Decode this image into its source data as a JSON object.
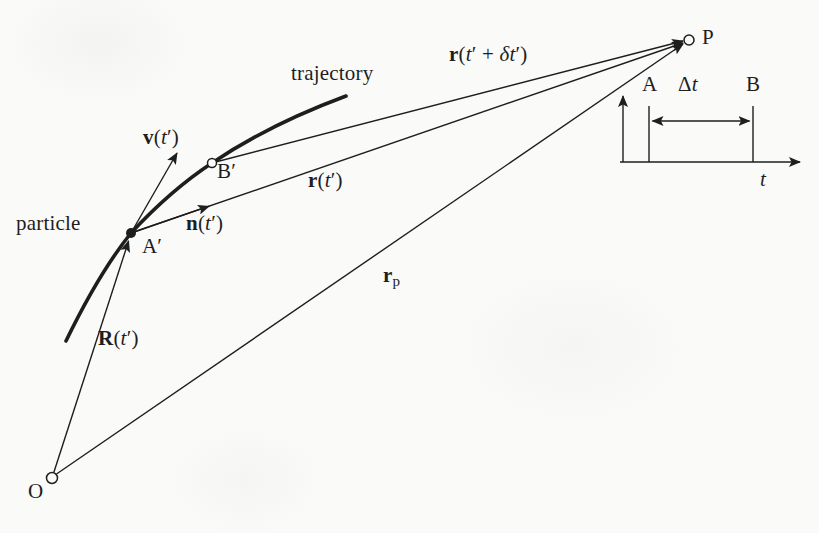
{
  "colors": {
    "background": "#fafaf9",
    "ink": "#1e1e1e"
  },
  "diagram": {
    "particle_label": "particle",
    "trajectory_label": "trajectory",
    "points": {
      "a_prime": "A′",
      "b_prime": "B′",
      "p": "P",
      "o": "O"
    },
    "vectors": {
      "velocity": {
        "vec": "v",
        "open": "(",
        "t": "t",
        "close": "′)"
      },
      "unit_vector": {
        "vec": "n",
        "open": "(",
        "t": "t",
        "close": "′)"
      },
      "r_t": {
        "vec": "r",
        "open": "(",
        "t": "t",
        "close": "′)"
      },
      "r_t_plus_delta": {
        "vec": "r",
        "open": "(",
        "t1": "t",
        "plus": "′ + ",
        "delta": "δ",
        "t2": "t",
        "close": "′)"
      },
      "position_R": {
        "vec": "R",
        "open": "(",
        "t": "t",
        "close": "′)"
      },
      "r_p": {
        "vec": "r",
        "sub": "p"
      }
    },
    "time_inset": {
      "tick_a": "A",
      "interval_delta": "Δ",
      "interval_t": "t",
      "tick_b": "B",
      "axis_label": "t"
    }
  }
}
